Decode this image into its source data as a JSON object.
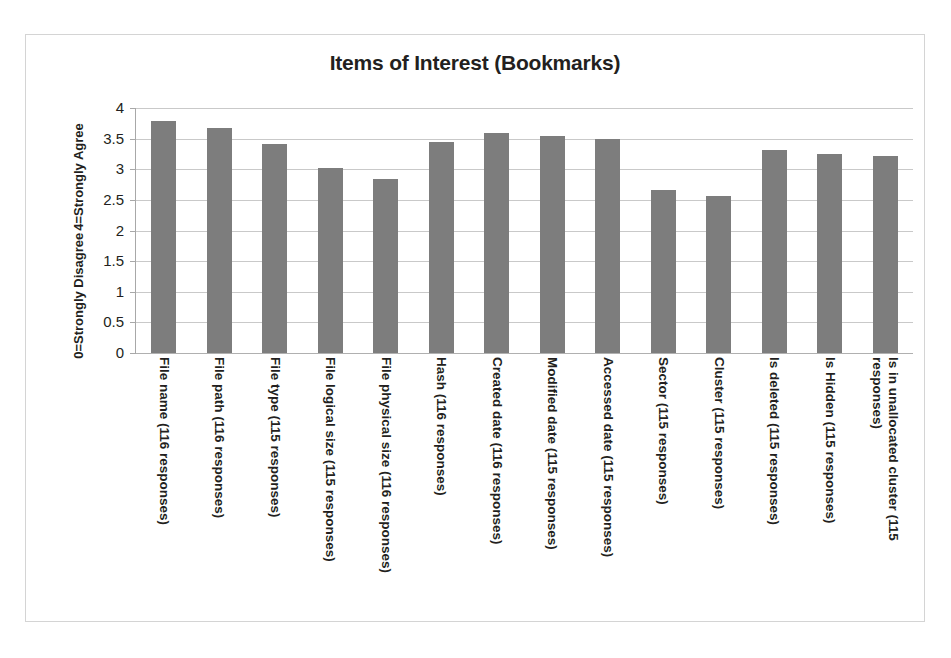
{
  "chart_data": {
    "type": "bar",
    "title": "Items of Interest (Bookmarks)",
    "xlabel": "",
    "ylabel": "0=Strongly Disagree 4=Strongly Agree",
    "ylabel_lines": [
      "0=Strongly Disagree",
      "4=Strongly Agree"
    ],
    "ylim": [
      0,
      4
    ],
    "ytick_labels": [
      "4",
      "3.5",
      "3",
      "2.5",
      "2",
      "1.5",
      "1",
      "0.5",
      "0"
    ],
    "ytick_values": [
      4,
      3.5,
      3,
      2.5,
      2,
      1.5,
      1,
      0.5,
      0
    ],
    "grid": true,
    "legend": false,
    "bar_color": "#7d7d7d",
    "categories": [
      "File name (116 responses)",
      "File path (116 responses)",
      "File type (115 responses)",
      "File logical size (115 responses)",
      "File physical size (116 responses)",
      "Hash (116 responses)",
      "Created date (116 responses)",
      "Modified date (115 responses)",
      "Accessed date (115 responses)",
      "Sector (115 responses)",
      "Cluster (115 responses)",
      "Is deleted (115 responses)",
      "Is Hidden (115 responses)",
      "Is in unallocated cluster (115 responses)"
    ],
    "values": [
      3.78,
      3.68,
      3.42,
      3.02,
      2.84,
      3.44,
      3.59,
      3.54,
      3.49,
      2.66,
      2.56,
      3.31,
      3.25,
      3.22
    ]
  }
}
